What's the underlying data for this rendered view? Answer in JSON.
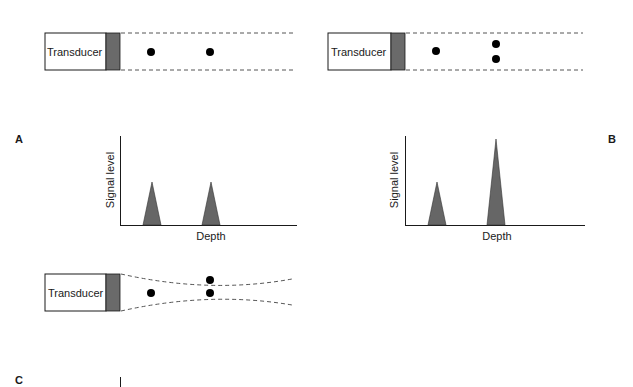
{
  "figure": {
    "panel_labels": {
      "a": "A",
      "b": "B",
      "c": "C"
    },
    "transducer_label": "Transducer",
    "axis": {
      "ylabel": "Signal level",
      "xlabel": "Depth"
    },
    "colors": {
      "face": "#6a6a6a",
      "peak": "#666666",
      "ink": "#1a1a1a",
      "dash": "#555555"
    }
  },
  "panels": [
    {
      "id": "A",
      "beam": "parallel",
      "reflectors": "two targets separated axially (in depth)",
      "peaks": [
        "equal",
        "equal"
      ]
    },
    {
      "id": "B",
      "beam": "parallel",
      "reflectors": "single target, then two targets side by side laterally",
      "peaks": [
        "small",
        "large (merged)"
      ]
    },
    {
      "id": "C",
      "beam": "focused (narrowing then diverging)",
      "reflectors": "single target, then two lateral targets at focal zone",
      "peaks": []
    }
  ]
}
